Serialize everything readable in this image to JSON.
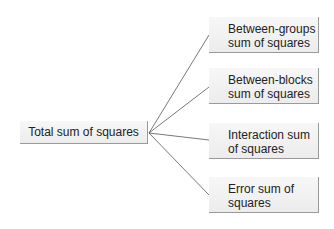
{
  "diagram": {
    "root": {
      "label": "Total sum of squares"
    },
    "children": [
      {
        "label": "Between-groups sum of squares"
      },
      {
        "label": "Between-blocks sum of squares"
      },
      {
        "label": "Interaction sum of squares"
      },
      {
        "label": "Error sum of squares"
      }
    ],
    "colors": {
      "box_fill": "#f0f0f0",
      "box_shadow": "#9a9a9a",
      "line": "#555555",
      "text": "#222222"
    }
  }
}
